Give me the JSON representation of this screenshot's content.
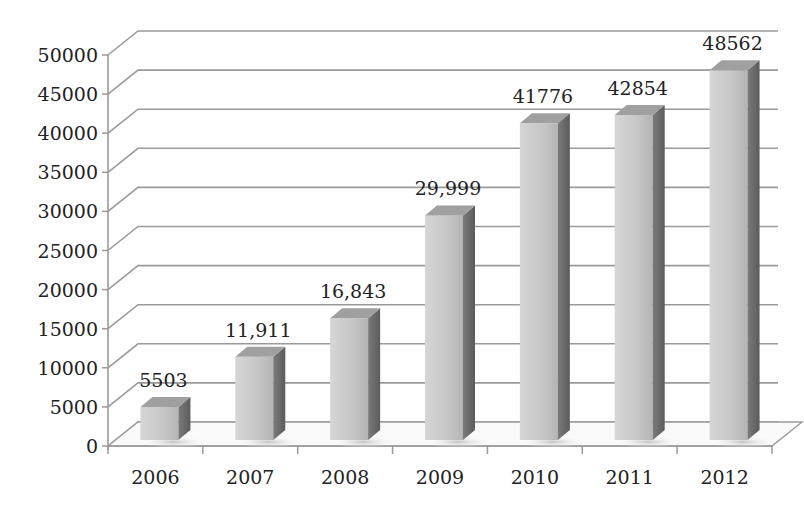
{
  "chart_data": {
    "type": "bar",
    "style": "3d-column",
    "title": "",
    "xlabel": "",
    "ylabel": "",
    "categories": [
      "2006",
      "2007",
      "2008",
      "2009",
      "2010",
      "2011",
      "2012"
    ],
    "values": [
      5503,
      11911,
      16843,
      29999,
      41776,
      42854,
      48562
    ],
    "data_labels": [
      "5503",
      "11,911",
      "16,843",
      "29,999",
      "41776",
      "42854",
      "48562"
    ],
    "yticks": [
      "0",
      "5000",
      "10000",
      "15000",
      "20000",
      "25000",
      "30000",
      "35000",
      "40000",
      "45000",
      "50000"
    ],
    "ylim": [
      0,
      50000
    ],
    "grid": true,
    "legend": null,
    "colors": {
      "bar_front": "#c8c8c8",
      "bar_side": "#6e6e6e",
      "bar_top": "#a0a0a0",
      "grid": "#9a9a9a",
      "text": "#222222"
    }
  }
}
